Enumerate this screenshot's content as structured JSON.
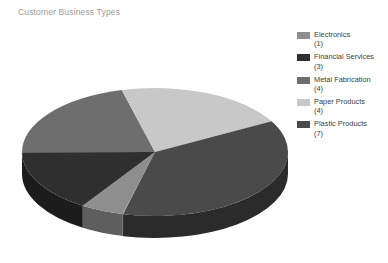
{
  "chart_data": {
    "type": "pie",
    "title": "Customer Business Types",
    "categories": [
      "Electronics",
      "Financial Services",
      "Metal Fabrication",
      "Paper Products",
      "Plastic Products"
    ],
    "values": [
      1,
      3,
      4,
      4,
      7
    ],
    "total": 19,
    "three_d": true,
    "legend_position": "right",
    "grid": false,
    "colors": [
      "#8e8e8e",
      "#2f2f2f",
      "#6e6e6e",
      "#c8c8c8",
      "#4a4a4a"
    ],
    "slices": [
      {
        "label": "Electronics",
        "value": 1,
        "count_label": "(1)",
        "color": "#8e8e8e",
        "side_color": "#5e5e5e",
        "start_angle": 104.0,
        "sweep": 18.9
      },
      {
        "label": "Financial Services",
        "value": 3,
        "count_label": "(3)",
        "color": "#2f2f2f",
        "side_color": "#1c1c1c",
        "start_angle": 122.9,
        "sweep": 56.8
      },
      {
        "label": "Metal Fabrication",
        "value": 4,
        "count_label": "(4)",
        "color": "#6e6e6e",
        "side_color": "#474747",
        "start_angle": 179.7,
        "sweep": 75.8
      },
      {
        "label": "Paper Products",
        "value": 4,
        "count_label": "(4)",
        "color": "#c8c8c8",
        "side_color": "#8a8a8a",
        "start_angle": 255.5,
        "sweep": 75.8
      },
      {
        "label": "Plastic Products",
        "value": 7,
        "count_label": "(7)",
        "color": "#4a4a4a",
        "side_color": "#2b2b2b",
        "start_angle": 331.3,
        "sweep": 132.6
      }
    ]
  },
  "legend": {
    "items": [
      {
        "label": "Electronics",
        "count_label": "(1)",
        "color": "#8e8e8e"
      },
      {
        "label": "Financial Services",
        "count_label": "(3)",
        "color": "#2f2f2f"
      },
      {
        "label": "Metal Fabrication",
        "count_label": "(4)",
        "color": "#6e6e6e"
      },
      {
        "label": "Paper Products",
        "count_label": "(4)",
        "color": "#c8c8c8"
      },
      {
        "label": "Plastic Products",
        "count_label": "(7)",
        "color": "#4a4a4a"
      }
    ]
  },
  "geometry": {
    "cx": 155,
    "cy": 104,
    "rx": 133,
    "ry": 64,
    "depth": 22
  }
}
